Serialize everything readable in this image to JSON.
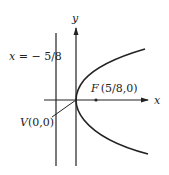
{
  "diagram": {
    "type": "parabola",
    "equation_implied": "y^2 = (5/2)x",
    "axes": {
      "x_label": "x",
      "y_label": "y"
    },
    "directrix": {
      "label": "x = − 5/8",
      "label_var": "x",
      "label_rest": " = − 5/8"
    },
    "focus": {
      "label_letter": "F",
      "label_coords": "(5/8,0)",
      "x": 0.625,
      "y": 0
    },
    "vertex": {
      "label_letter": "V",
      "label_coords": "(0,0)",
      "x": 0,
      "y": 0
    },
    "colors": {
      "stroke": "#222222",
      "background": "#ffffff"
    }
  }
}
